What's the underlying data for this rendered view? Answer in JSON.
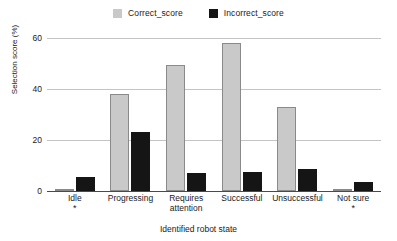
{
  "chart_data": {
    "type": "bar",
    "title": "",
    "xlabel": "Identified robot state",
    "ylabel": "Selection score (%)",
    "categories": [
      "Idle",
      "Progressing",
      "Requires\nattention",
      "Successful",
      "Unsuccessful",
      "Not sure"
    ],
    "category_lines": [
      [
        "Idle"
      ],
      [
        "Progressing"
      ],
      [
        "Requires",
        "attention"
      ],
      [
        "Successful"
      ],
      [
        "Unsuccessful"
      ],
      [
        "Not sure"
      ]
    ],
    "category_footnotes": [
      "*",
      "",
      "",
      "",
      "",
      "*"
    ],
    "series": [
      {
        "name": "Correct_score",
        "color": "#c9c9c9",
        "values": [
          0.5,
          38,
          49.5,
          58,
          33,
          0.5
        ]
      },
      {
        "name": "Incorrect_score",
        "color": "#151515",
        "values": [
          5.5,
          23,
          7,
          7.5,
          8.5,
          3.5
        ]
      }
    ],
    "ylim": [
      0,
      62
    ],
    "yticks": [
      0,
      20,
      40,
      60
    ],
    "ytick_labels": [
      "0",
      "20",
      "40",
      "60"
    ],
    "grid": true,
    "legend_position": "top-center"
  },
  "legend": {
    "entries": [
      {
        "label": "Correct_score",
        "color": "#c9c9c9"
      },
      {
        "label": "Incorrect_score",
        "color": "#151515"
      }
    ]
  }
}
